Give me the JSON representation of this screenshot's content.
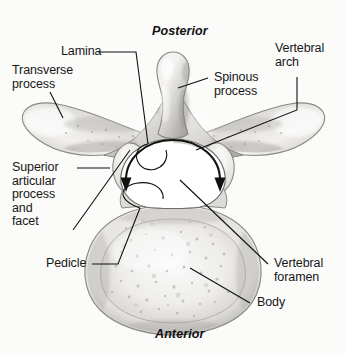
{
  "figure": {
    "background_color": "#fbfbfa",
    "ink_color": "#171717",
    "bone_light": "#f2f1ef",
    "bone_mid": "#c9c7c4",
    "bone_dark": "#8d8b88",
    "foramen_fill": "#ffffff"
  },
  "orientation": {
    "top_label": "Posterior",
    "bottom_label": "Anterior"
  },
  "labels": [
    {
      "id": "lamina",
      "text": "Lamina"
    },
    {
      "id": "transverse_process",
      "text": "Transverse\nprocess"
    },
    {
      "id": "superior_articular",
      "text": "Superior\narticular\nprocess\nand\nfacet"
    },
    {
      "id": "pedicle",
      "text": "Pedicle"
    },
    {
      "id": "spinous_process",
      "text": "Spinous\nprocess"
    },
    {
      "id": "vertebral_arch",
      "text": "Vertebral\narch"
    },
    {
      "id": "vertebral_foramen",
      "text": "Vertebral\nforamen"
    },
    {
      "id": "body",
      "text": "Body"
    }
  ]
}
